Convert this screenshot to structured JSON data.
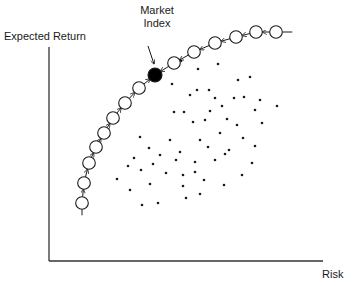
{
  "diagram": {
    "y_axis_label": "Expected Return",
    "x_axis_label": "Risk",
    "annotation": {
      "line1": "Market",
      "line2": "Index"
    },
    "colors": {
      "ink": "#1a1a1a",
      "background": "#ffffff",
      "market_point": "#000000"
    }
  },
  "frontier_points": [
    {
      "x": 82,
      "y": 203
    },
    {
      "x": 84,
      "y": 183
    },
    {
      "x": 89,
      "y": 163
    },
    {
      "x": 96,
      "y": 147
    },
    {
      "x": 104,
      "y": 133
    },
    {
      "x": 113,
      "y": 118
    },
    {
      "x": 125,
      "y": 103
    },
    {
      "x": 139,
      "y": 88
    },
    {
      "x": 155,
      "y": 75,
      "market": true
    },
    {
      "x": 174,
      "y": 63
    },
    {
      "x": 194,
      "y": 52
    },
    {
      "x": 215,
      "y": 43
    },
    {
      "x": 236,
      "y": 37
    },
    {
      "x": 256,
      "y": 32
    },
    {
      "x": 276,
      "y": 32
    }
  ],
  "portfolio_dots": [
    [
      181,
      61
    ],
    [
      198,
      69
    ],
    [
      218,
      64
    ],
    [
      238,
      80
    ],
    [
      250,
      77
    ],
    [
      197,
      90
    ],
    [
      209,
      90
    ],
    [
      215,
      98
    ],
    [
      234,
      98
    ],
    [
      260,
      100
    ],
    [
      172,
      84
    ],
    [
      190,
      95
    ],
    [
      222,
      106
    ],
    [
      244,
      97
    ],
    [
      255,
      110
    ],
    [
      277,
      106
    ],
    [
      174,
      112
    ],
    [
      184,
      112
    ],
    [
      210,
      111
    ],
    [
      227,
      119
    ],
    [
      205,
      120
    ],
    [
      237,
      125
    ],
    [
      262,
      123
    ],
    [
      193,
      122
    ],
    [
      140,
      137
    ],
    [
      149,
      148
    ],
    [
      170,
      140
    ],
    [
      176,
      160
    ],
    [
      200,
      140
    ],
    [
      208,
      147
    ],
    [
      220,
      133
    ],
    [
      243,
      138
    ],
    [
      255,
      146
    ],
    [
      153,
      164
    ],
    [
      160,
      155
    ],
    [
      180,
      152
    ],
    [
      195,
      162
    ],
    [
      215,
      160
    ],
    [
      225,
      154
    ],
    [
      134,
      158
    ],
    [
      128,
      166
    ],
    [
      141,
      170
    ],
    [
      150,
      184
    ],
    [
      166,
      173
    ],
    [
      183,
      175
    ],
    [
      195,
      172
    ],
    [
      204,
      180
    ],
    [
      117,
      179
    ],
    [
      130,
      190
    ],
    [
      142,
      205
    ],
    [
      158,
      203
    ],
    [
      183,
      186
    ],
    [
      186,
      198
    ],
    [
      200,
      194
    ],
    [
      229,
      150
    ],
    [
      252,
      163
    ],
    [
      242,
      175
    ],
    [
      224,
      185
    ]
  ]
}
